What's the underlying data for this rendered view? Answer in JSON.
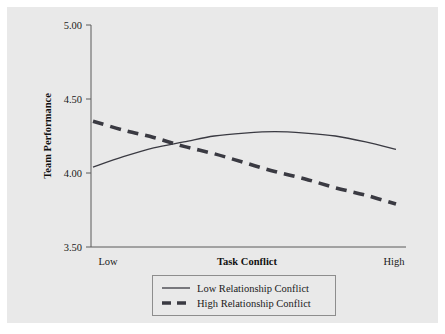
{
  "chart_data": {
    "type": "line",
    "title": "",
    "xlabel": "Task Conflict",
    "ylabel": "Team Performance",
    "ylim": [
      3.5,
      5.0
    ],
    "yticks": [
      "3.50",
      "4.00",
      "4.50",
      "5.00"
    ],
    "ytick_values": [
      3.5,
      4.0,
      4.5,
      5.0
    ],
    "xlim": [
      0,
      1
    ],
    "xtick_labels": [
      "Low",
      "High"
    ],
    "grid": false,
    "legend_position": "bottom-center",
    "x": [
      0,
      0.1,
      0.2,
      0.3,
      0.4,
      0.5,
      0.6,
      0.7,
      0.8,
      0.9,
      1.0
    ],
    "series": [
      {
        "name": "Low Relationship Conflict",
        "style": "solid",
        "color": "#3a3a42",
        "values": [
          4.04,
          4.11,
          4.17,
          4.21,
          4.25,
          4.27,
          4.28,
          4.27,
          4.25,
          4.21,
          4.16
        ]
      },
      {
        "name": "High Relationship Conflict",
        "style": "dashed",
        "color": "#3a3a42",
        "values": [
          4.35,
          4.29,
          4.24,
          4.18,
          4.13,
          4.07,
          4.01,
          3.96,
          3.9,
          3.85,
          3.79
        ]
      }
    ],
    "annotations": {
      "crossover_x": 0.33,
      "crossover_y": 4.21
    }
  },
  "axes": {
    "y_title": "Team Performance",
    "x_title": "Task Conflict",
    "y_tick_0": "3.50",
    "y_tick_1": "4.00",
    "y_tick_2": "4.50",
    "y_tick_3": "5.00",
    "x_tick_low": "Low",
    "x_tick_high": "High"
  },
  "legend": {
    "entries": [
      {
        "label": "Low Relationship Conflict",
        "style": "solid"
      },
      {
        "label": "High Relationship Conflict",
        "style": "dashed"
      }
    ]
  },
  "colors": {
    "panel_background": "#e9e9e9",
    "figure_background": "#ffffff",
    "line_color": "#3a3a42",
    "axis_color": "#5a5a5a",
    "text_color": "#1a1a1a"
  }
}
